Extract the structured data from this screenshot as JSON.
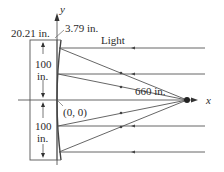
{
  "diagram": {
    "axes": {
      "x_label": "x",
      "y_label": "y"
    },
    "labels": {
      "rim_height": "20.21 in.",
      "rim_depth": "3.79 in.",
      "light": "Light",
      "upper_half": "100",
      "upper_half_unit": "in.",
      "lower_half": "100",
      "lower_half_unit": "in.",
      "focal_distance": "660 in.",
      "origin": "(0, 0)"
    },
    "colors": {
      "line": "#555555",
      "text": "#2a2a2a"
    }
  }
}
